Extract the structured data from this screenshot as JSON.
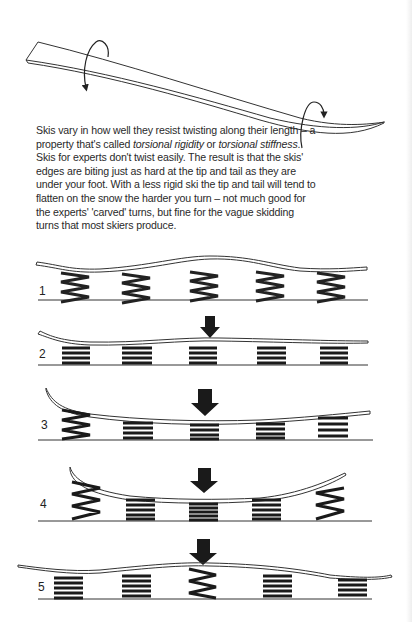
{
  "caption": {
    "part1": "Skis vary in how well they resist twisting along their length – a property that's called ",
    "term1": "torsional rigidity",
    "part2": " or ",
    "term2": "torsional stiffness",
    "part3": ". Skis for experts don't twist easily. The result is that the skis' edges are biting just as hard at the tip and tail as they are under your foot. With a less rigid ski the tip and tail will tend to flatten on the snow the harder you turn – not much good for the experts' 'carved' turns, but fine for the vague skidding turns that most skiers produce."
  },
  "panels": [
    {
      "number": "1",
      "pressure_arrow": false
    },
    {
      "number": "2",
      "pressure_arrow": true
    },
    {
      "number": "3",
      "pressure_arrow": true
    },
    {
      "number": "4",
      "pressure_arrow": true
    },
    {
      "number": "5",
      "pressure_arrow": true
    }
  ],
  "colors": {
    "ink": "#222222",
    "background": "#ffffff"
  }
}
